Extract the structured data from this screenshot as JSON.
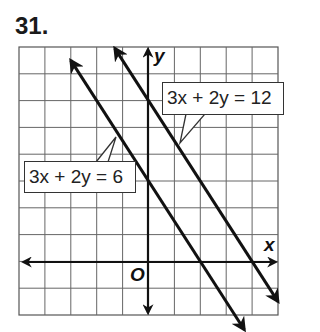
{
  "problem_number": "31.",
  "chart_data": {
    "type": "line",
    "title": "31.",
    "xlabel": "x",
    "ylabel": "y",
    "origin_label": "O",
    "xlim": [
      -5,
      5
    ],
    "ylim": [
      -2,
      8
    ],
    "grid": true,
    "grid_step": 1,
    "series": [
      {
        "name": "3x + 2y = 6",
        "equation": "3x + 2y = 6",
        "x_intercept": 2,
        "y_intercept": 3,
        "slope": -1.5,
        "points": [
          [
            -3,
            7.5
          ],
          [
            2,
            0
          ],
          [
            3.7,
            -2.55
          ]
        ]
      },
      {
        "name": "3x + 2y = 12",
        "equation": "3x + 2y = 12",
        "x_intercept": 4,
        "y_intercept": 6,
        "slope": -1.5,
        "points": [
          [
            -1.3,
            7.95
          ],
          [
            4,
            0
          ],
          [
            5,
            -1.5
          ]
        ]
      }
    ],
    "annotations": [
      {
        "text": "3x + 2y = 6",
        "points_to_line": 0
      },
      {
        "text": "3x + 2y = 12",
        "points_to_line": 1
      }
    ]
  },
  "labels": {
    "line1": "3x + 2y = 6",
    "line2": "3x + 2y = 12",
    "x_axis": "x",
    "y_axis": "y",
    "origin": "O"
  }
}
